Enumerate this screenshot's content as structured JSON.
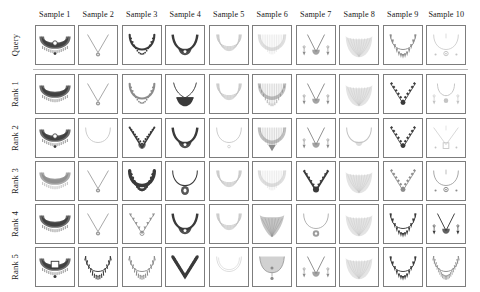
{
  "figure": {
    "type": "retrieval-results-grid",
    "columns": 10,
    "rows": 6
  },
  "column_headers": [
    {
      "label": "Sample 1"
    },
    {
      "label": "Sample 2"
    },
    {
      "label": "Sample 3"
    },
    {
      "label": "Sample 4"
    },
    {
      "label": "Sample 5"
    },
    {
      "label": "Sample 6"
    },
    {
      "label": "Sample 7"
    },
    {
      "label": "Sample 8"
    },
    {
      "label": "Sample 9"
    },
    {
      "label": "Sample 10"
    }
  ],
  "row_labels": [
    {
      "label": "Query"
    },
    {
      "label": "Rank 1"
    },
    {
      "label": "Rank 2"
    },
    {
      "label": "Rank 3"
    },
    {
      "label": "Rank 4"
    },
    {
      "label": "Rank 5"
    }
  ],
  "colors": {
    "background": "#ffffff",
    "thumb_border": "#7d7d7d",
    "separator": "#b9b9b9",
    "text": "#1a1a1a",
    "jewelry_dark": "#3a3a3a",
    "jewelry_mid": "#8c8c8c",
    "jewelry_light": "#c4c4c4"
  },
  "cells": [
    {
      "row": "Query",
      "col": "Sample 1",
      "item": "wide-choker-necklace-with-pendant",
      "tone": "dark"
    },
    {
      "row": "Query",
      "col": "Sample 2",
      "item": "thin-chain-necklace-with-round-pendant",
      "tone": "mid"
    },
    {
      "row": "Query",
      "col": "Sample 3",
      "item": "beaded-u-necklace",
      "tone": "dark"
    },
    {
      "row": "Query",
      "col": "Sample 4",
      "item": "v-necklace-with-center-stone",
      "tone": "dark"
    },
    {
      "row": "Query",
      "col": "Sample 5",
      "item": "layered-u-collar",
      "tone": "light"
    },
    {
      "row": "Query",
      "col": "Sample 6",
      "item": "wide-mesh-u-collar",
      "tone": "light"
    },
    {
      "row": "Query",
      "col": "Sample 7",
      "item": "necklace-with-earrings-set",
      "tone": "mid"
    },
    {
      "row": "Query",
      "col": "Sample 8",
      "item": "broad-filigree-bib-necklace",
      "tone": "light"
    },
    {
      "row": "Query",
      "col": "Sample 9",
      "item": "spiked-u-necklace",
      "tone": "mid"
    },
    {
      "row": "Query",
      "col": "Sample 10",
      "item": "thin-v-chain-with-pendant-and-studs",
      "tone": "light"
    },
    {
      "row": "Rank 1",
      "col": "Sample 1",
      "item": "wide-choker-necklace-with-fringe",
      "tone": "dark"
    },
    {
      "row": "Rank 1",
      "col": "Sample 2",
      "item": "thin-chain-necklace-with-round-pendant",
      "tone": "mid"
    },
    {
      "row": "Rank 1",
      "col": "Sample 3",
      "item": "beaded-u-necklace",
      "tone": "mid"
    },
    {
      "row": "Rank 1",
      "col": "Sample 4",
      "item": "solid-dark-bib-necklace",
      "tone": "dark"
    },
    {
      "row": "Rank 1",
      "col": "Sample 5",
      "item": "layered-u-collar",
      "tone": "light"
    },
    {
      "row": "Rank 1",
      "col": "Sample 6",
      "item": "fringed-u-collar",
      "tone": "mid"
    },
    {
      "row": "Rank 1",
      "col": "Sample 7",
      "item": "necklace-with-earrings-set",
      "tone": "mid"
    },
    {
      "row": "Rank 1",
      "col": "Sample 8",
      "item": "broad-filigree-bib-necklace",
      "tone": "light"
    },
    {
      "row": "Rank 1",
      "col": "Sample 9",
      "item": "beaded-v-necklace-with-pendant",
      "tone": "dark"
    },
    {
      "row": "Rank 1",
      "col": "Sample 10",
      "item": "thin-v-chain-with-earrings",
      "tone": "light"
    },
    {
      "row": "Rank 2",
      "col": "Sample 1",
      "item": "wide-choker-necklace-with-pendant",
      "tone": "dark"
    },
    {
      "row": "Rank 2",
      "col": "Sample 2",
      "item": "plain-u-chain-necklace",
      "tone": "light"
    },
    {
      "row": "Rank 2",
      "col": "Sample 3",
      "item": "black-beaded-necklace-with-pendant",
      "tone": "dark"
    },
    {
      "row": "Rank 2",
      "col": "Sample 4",
      "item": "v-necklace-with-center-stone",
      "tone": "dark"
    },
    {
      "row": "Rank 2",
      "col": "Sample 5",
      "item": "plain-thin-chain-necklace",
      "tone": "light"
    },
    {
      "row": "Rank 2",
      "col": "Sample 6",
      "item": "wide-collar-with-pendant",
      "tone": "mid"
    },
    {
      "row": "Rank 2",
      "col": "Sample 7",
      "item": "necklace-with-earrings-set",
      "tone": "mid"
    },
    {
      "row": "Rank 2",
      "col": "Sample 8",
      "item": "u-necklace-with-small-pendant",
      "tone": "light"
    },
    {
      "row": "Rank 2",
      "col": "Sample 9",
      "item": "gemstone-v-necklace",
      "tone": "dark"
    },
    {
      "row": "Rank 2",
      "col": "Sample 10",
      "item": "thin-v-chain-with-square-pendant",
      "tone": "light"
    },
    {
      "row": "Rank 3",
      "col": "Sample 1",
      "item": "wide-choker-mesh-necklace",
      "tone": "mid"
    },
    {
      "row": "Rank 3",
      "col": "Sample 2",
      "item": "thin-chain-necklace-with-round-pendant",
      "tone": "mid"
    },
    {
      "row": "Rank 3",
      "col": "Sample 3",
      "item": "thick-beaded-u-necklace",
      "tone": "dark"
    },
    {
      "row": "Rank 3",
      "col": "Sample 4",
      "item": "necklace-with-large-oval-pendant",
      "tone": "dark"
    },
    {
      "row": "Rank 3",
      "col": "Sample 5",
      "item": "multi-strand-layered-necklace",
      "tone": "light"
    },
    {
      "row": "Rank 3",
      "col": "Sample 6",
      "item": "wide-mesh-u-collar",
      "tone": "light"
    },
    {
      "row": "Rank 3",
      "col": "Sample 7",
      "item": "v-necklace-with-center-pendant",
      "tone": "dark"
    },
    {
      "row": "Rank 3",
      "col": "Sample 8",
      "item": "broad-filigree-bib-necklace",
      "tone": "light"
    },
    {
      "row": "Rank 3",
      "col": "Sample 9",
      "item": "beaded-v-necklace-with-pendant",
      "tone": "mid"
    },
    {
      "row": "Rank 3",
      "col": "Sample 10",
      "item": "u-necklace-with-pendant-and-studs",
      "tone": "mid"
    },
    {
      "row": "Rank 4",
      "col": "Sample 1",
      "item": "wide-choker-necklace-with-fringe",
      "tone": "dark"
    },
    {
      "row": "Rank 4",
      "col": "Sample 2",
      "item": "thin-chain-necklace-with-round-pendant",
      "tone": "mid"
    },
    {
      "row": "Rank 4",
      "col": "Sample 3",
      "item": "scalloped-necklace-with-drops",
      "tone": "mid"
    },
    {
      "row": "Rank 4",
      "col": "Sample 4",
      "item": "dark-v-necklace-with-center-stone",
      "tone": "dark"
    },
    {
      "row": "Rank 4",
      "col": "Sample 5",
      "item": "multi-strand-layered-necklace",
      "tone": "light"
    },
    {
      "row": "Rank 4",
      "col": "Sample 6",
      "item": "triangular-bib-necklace",
      "tone": "mid"
    },
    {
      "row": "Rank 4",
      "col": "Sample 7",
      "item": "thin-chain-with-large-pendant",
      "tone": "mid"
    },
    {
      "row": "Rank 4",
      "col": "Sample 8",
      "item": "broad-filigree-bib-necklace",
      "tone": "light"
    },
    {
      "row": "Rank 4",
      "col": "Sample 9",
      "item": "large-beaded-u-necklace",
      "tone": "dark"
    },
    {
      "row": "Rank 4",
      "col": "Sample 10",
      "item": "v-necklace-with-earrings-set",
      "tone": "dark"
    },
    {
      "row": "Rank 5",
      "col": "Sample 1",
      "item": "wide-choker-with-square-centerpiece",
      "tone": "dark"
    },
    {
      "row": "Rank 5",
      "col": "Sample 2",
      "item": "fringed-u-necklace",
      "tone": "dark"
    },
    {
      "row": "Rank 5",
      "col": "Sample 3",
      "item": "fringed-u-necklace",
      "tone": "mid"
    },
    {
      "row": "Rank 5",
      "col": "Sample 4",
      "item": "thick-beaded-v-necklace",
      "tone": "dark"
    },
    {
      "row": "Rank 5",
      "col": "Sample 5",
      "item": "faint-plain-necklace",
      "tone": "light"
    },
    {
      "row": "Rank 5",
      "col": "Sample 6",
      "item": "collar-with-drop-pendant",
      "tone": "mid"
    },
    {
      "row": "Rank 5",
      "col": "Sample 7",
      "item": "necklace-with-earrings-set",
      "tone": "mid"
    },
    {
      "row": "Rank 5",
      "col": "Sample 8",
      "item": "broad-filigree-bib-necklace",
      "tone": "light"
    },
    {
      "row": "Rank 5",
      "col": "Sample 9",
      "item": "large-beaded-u-necklace",
      "tone": "dark"
    },
    {
      "row": "Rank 5",
      "col": "Sample 10",
      "item": "dense-beaded-u-necklace",
      "tone": "mid"
    }
  ]
}
